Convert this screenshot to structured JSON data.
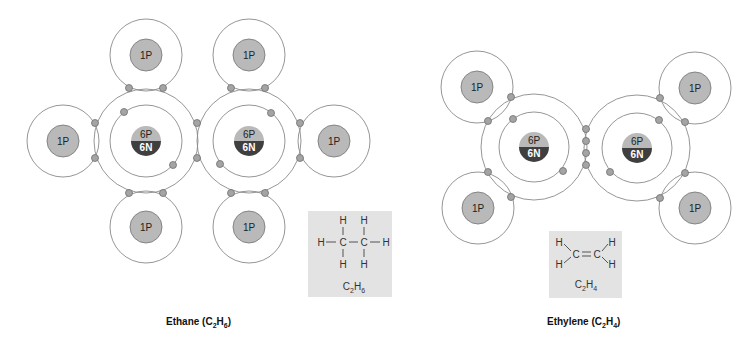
{
  "diagrams": [
    {
      "name": "ethane",
      "caption": {
        "main": "Ethane (C",
        "sub1": "2",
        "mid": "H",
        "sub2": "6",
        "end": ")"
      },
      "carbon_label_p": "6P",
      "carbon_label_n": "6N",
      "hydrogen_label": "1P",
      "formula": {
        "c": "C",
        "c_sub": "2",
        "h": "H",
        "h_sub": "6"
      },
      "structure_atoms": [
        "H",
        "H",
        "H",
        "C",
        "C",
        "H",
        "H",
        "H"
      ]
    },
    {
      "name": "ethylene",
      "caption": {
        "main": "Ethylene (C",
        "sub1": "2",
        "mid": "H",
        "sub2": "4",
        "end": ")"
      },
      "carbon_label_p": "6P",
      "carbon_label_n": "6N",
      "hydrogen_label": "1P",
      "formula": {
        "c": "C",
        "c_sub": "2",
        "h": "H",
        "h_sub": "4"
      },
      "structure_atoms": [
        "H",
        "H",
        "C",
        "C",
        "H",
        "H"
      ]
    }
  ],
  "colors": {
    "proton_fill": "#b9b9b9",
    "neutron_fill": "#3f3f3f",
    "electron_fill": "#a4a4a4",
    "structure_box": "#e3e3e3"
  }
}
